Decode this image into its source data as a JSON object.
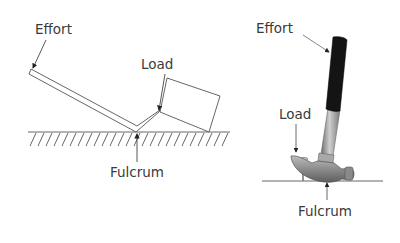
{
  "left_diagram": {
    "subject": "lever",
    "labels": {
      "effort": "Effort",
      "load": "Load",
      "fulcrum": "Fulcrum"
    }
  },
  "right_diagram": {
    "subject": "claw hammer",
    "labels": {
      "effort": "Effort",
      "load": "Load",
      "fulcrum": "Fulcrum"
    }
  },
  "colors": {
    "line": "#555555",
    "text": "#3a3a3a",
    "grip": "#111111",
    "metal": "#9a9a9a"
  }
}
